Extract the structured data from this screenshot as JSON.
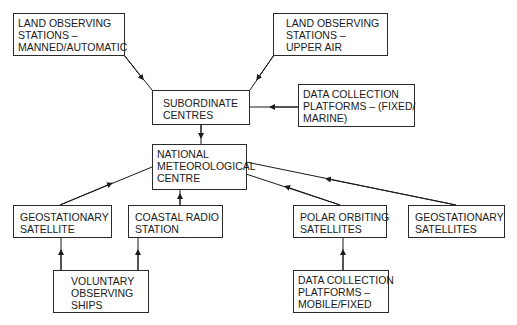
{
  "diagram": {
    "type": "flowchart",
    "nodes": [
      {
        "id": "land_manned",
        "lines": [
          "LAND OBSERVING",
          "STATIONS –",
          "MANNED/AUTOMATIC"
        ]
      },
      {
        "id": "land_upper",
        "lines": [
          "LAND OBSERVING",
          "STATIONS –",
          "UPPER AIR"
        ]
      },
      {
        "id": "subordinate",
        "lines": [
          "SUBORDINATE",
          "CENTRES"
        ]
      },
      {
        "id": "dcp_fixed_marine",
        "lines": [
          "DATA COLLECTION",
          "PLATFORMS – (FIXED/",
          "MARINE)"
        ]
      },
      {
        "id": "nmc",
        "lines": [
          "NATIONAL",
          "METEOROLOGICAL",
          "CENTRE"
        ]
      },
      {
        "id": "geo_satellite",
        "lines": [
          "GEOSTATIONARY",
          "SATELLITE"
        ]
      },
      {
        "id": "coastal_radio",
        "lines": [
          "COASTAL RADIO",
          "STATION"
        ]
      },
      {
        "id": "polar",
        "lines": [
          "POLAR ORBITING",
          "SATELLITES"
        ]
      },
      {
        "id": "geo_satellites",
        "lines": [
          "GEOSTATIONARY",
          "SATELLITES"
        ]
      },
      {
        "id": "ships",
        "lines": [
          "VOLUNTARY",
          "OBSERVING",
          "SHIPS"
        ]
      },
      {
        "id": "dcp_mobile",
        "lines": [
          "DATA COLLECTION",
          "PLATFORMS –",
          "MOBILE/FIXED"
        ]
      }
    ],
    "edges": [
      {
        "from": "land_manned",
        "to": "subordinate"
      },
      {
        "from": "land_upper",
        "to": "subordinate"
      },
      {
        "from": "dcp_fixed_marine",
        "to": "subordinate"
      },
      {
        "from": "subordinate",
        "to": "nmc"
      },
      {
        "from": "geo_satellite",
        "to": "nmc"
      },
      {
        "from": "coastal_radio",
        "to": "nmc"
      },
      {
        "from": "polar",
        "to": "nmc"
      },
      {
        "from": "geo_satellites",
        "to": "nmc"
      },
      {
        "from": "ships",
        "to": "geo_satellite"
      },
      {
        "from": "ships",
        "to": "coastal_radio"
      },
      {
        "from": "dcp_mobile",
        "to": "polar"
      }
    ]
  }
}
